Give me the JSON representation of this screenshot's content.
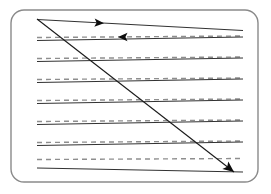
{
  "figure": {
    "caption": "",
    "width": 271,
    "height": 194,
    "background_color": "#ffffff"
  },
  "frame": {
    "name": "rounded-rectangle-border",
    "x": 11,
    "y": 10,
    "width": 247,
    "height": 172,
    "corner_radius": 13,
    "stroke_color": "#8a8a8a",
    "stroke_width": 1.4,
    "fill": "none"
  },
  "style": {
    "solid_line_color": "#1a1a1a",
    "solid_line_width": 0.9,
    "dashed_line_color": "#8e8e8e",
    "dashed_line_width": 1.4,
    "dash_pattern": "5 4",
    "traverse_color": "#1a1a1a",
    "traverse_width": 1.1,
    "arrow_fill": "#0d0d0d"
  },
  "sweep_geometry": {
    "description": "Seven horizontal bands of slanted sweep lines spanning the interior; each band has an upper solid line and a lower solid line converging toward the right, with a gray dashed centerline between them.",
    "x_start": 37,
    "x_end": 243,
    "band_count": 7,
    "band_spacing": 22.5,
    "left_slope_offset": -2.5,
    "right_slope_offset": 9.0
  },
  "bands": [
    {
      "index": 0,
      "name": "sweep-band-1",
      "solid_upper": {
        "x1": 37,
        "y1": 19.5,
        "x2": 243,
        "y2": 30.5
      },
      "dashed_mid": {
        "x1": 37,
        "y1": 37.5,
        "x2": 243,
        "y2": 36.0
      },
      "solid_lower": {
        "x1": 37,
        "y1": 40.5,
        "x2": 243,
        "y2": 37.0
      }
    },
    {
      "index": 1,
      "name": "sweep-band-2",
      "solid_upper": {
        "x1": 37,
        "y1": 40.5,
        "x2": 243,
        "y2": 37.0
      },
      "dashed_mid": {
        "x1": 37,
        "y1": 58.5,
        "x2": 243,
        "y2": 57.0
      },
      "solid_lower": {
        "x1": 37,
        "y1": 61.5,
        "x2": 243,
        "y2": 58.0
      }
    },
    {
      "index": 2,
      "name": "sweep-band-3",
      "solid_upper": {
        "x1": 37,
        "y1": 61.5,
        "x2": 243,
        "y2": 58.0
      },
      "dashed_mid": {
        "x1": 37,
        "y1": 79.5,
        "x2": 243,
        "y2": 78.0
      },
      "solid_lower": {
        "x1": 37,
        "y1": 82.5,
        "x2": 243,
        "y2": 79.0
      }
    },
    {
      "index": 3,
      "name": "sweep-band-4",
      "solid_upper": {
        "x1": 37,
        "y1": 82.5,
        "x2": 243,
        "y2": 79.0
      },
      "dashed_mid": {
        "x1": 37,
        "y1": 100.5,
        "x2": 243,
        "y2": 99.0
      },
      "solid_lower": {
        "x1": 37,
        "y1": 103.5,
        "x2": 243,
        "y2": 100.0
      }
    },
    {
      "index": 4,
      "name": "sweep-band-5",
      "solid_upper": {
        "x1": 37,
        "y1": 103.5,
        "x2": 243,
        "y2": 100.0
      },
      "dashed_mid": {
        "x1": 37,
        "y1": 121.5,
        "x2": 243,
        "y2": 120.0
      },
      "solid_lower": {
        "x1": 37,
        "y1": 124.5,
        "x2": 243,
        "y2": 121.0
      }
    },
    {
      "index": 5,
      "name": "sweep-band-6",
      "solid_upper": {
        "x1": 37,
        "y1": 124.5,
        "x2": 243,
        "y2": 121.0
      },
      "dashed_mid": {
        "x1": 37,
        "y1": 142.5,
        "x2": 243,
        "y2": 141.0
      },
      "solid_lower": {
        "x1": 37,
        "y1": 145.5,
        "x2": 243,
        "y2": 142.0
      }
    },
    {
      "index": 6,
      "name": "sweep-band-7",
      "solid_upper": {
        "x1": 37,
        "y1": 145.5,
        "x2": 243,
        "y2": 142.0
      },
      "dashed_mid": {
        "x1": 37,
        "y1": 159.5,
        "x2": 243,
        "y2": 158.5
      },
      "solid_lower": {
        "x1": 37,
        "y1": 168.0,
        "x2": 243,
        "y2": 172.0
      }
    }
  ],
  "traverse": {
    "name": "diagonal-traverse-arrow",
    "x1": 37,
    "y1": 19,
    "x2": 234,
    "y2": 172,
    "arrow_direction": "down-right",
    "arrow_tip": {
      "x": 234,
      "y": 172
    },
    "arrow_size": 11
  },
  "arrows": [
    {
      "name": "sweep-arrow-right",
      "direction": "right",
      "on_line": "solid_upper band 1",
      "tip_x": 104,
      "tip_y": 23.2,
      "size": 9.5,
      "rotation_deg": 3.05
    },
    {
      "name": "sweep-arrow-left",
      "direction": "left",
      "on_line": "dashed_mid band 1",
      "tip_x": 118,
      "tip_y": 36.9,
      "size": 9.5,
      "rotation_deg": 180.4
    }
  ]
}
